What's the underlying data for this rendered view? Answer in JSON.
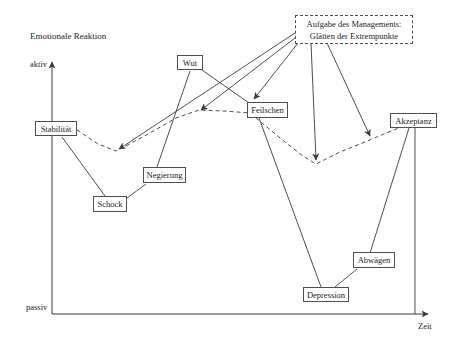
{
  "page": {
    "background": "#ffffff"
  },
  "colors": {
    "line": "#3a3a3a",
    "box_border": "#4f4f4f",
    "text": "#1c1c1c"
  },
  "diagram": {
    "y_axis_title": "Emotionale Reaktion",
    "y_axis_top_label": "aktiv",
    "y_axis_bottom_label": "passiv",
    "x_axis_label": "Zeit",
    "management_note": {
      "line1": "Aufgabe des Managements:",
      "line2": "Glätten der Extrempunkte"
    },
    "stages": [
      {
        "label": "Stabilität"
      },
      {
        "label": "Schock"
      },
      {
        "label": "Negierung"
      },
      {
        "label": "Wut"
      },
      {
        "label": "Feilschen"
      },
      {
        "label": "Depression"
      },
      {
        "label": "Abwägen"
      },
      {
        "label": "Akzeptanz"
      }
    ]
  }
}
